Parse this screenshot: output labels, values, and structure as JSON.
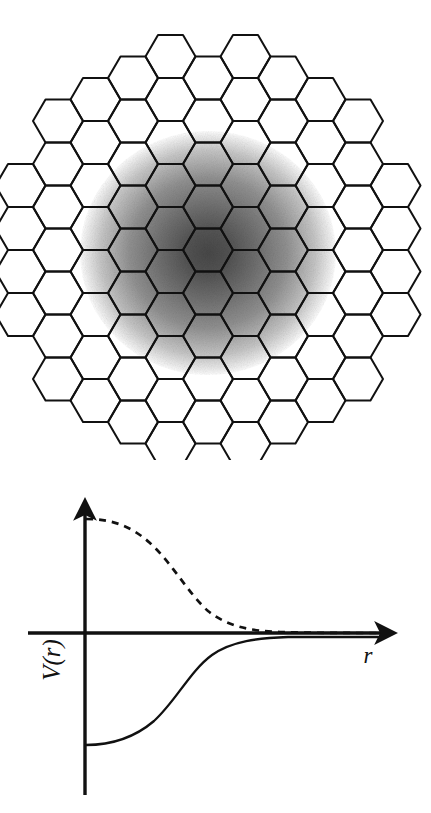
{
  "figure": {
    "title": "",
    "caption": "",
    "background_color": "#ffffff",
    "width": 431,
    "height": 813
  },
  "lattice_panel": {
    "name": "hexagonal-lattice-with-gaussian-blob",
    "description": "Honeycomb lattice of flat-top hexagons arranged in a roughly circular cluster, overlaid on a dark radial gradient blob centred on the lattice",
    "hexagon": {
      "orientation": "flat-top",
      "width_px": 50,
      "height_px": 43,
      "stroke_color": "#111111",
      "stroke_width": 2.0,
      "fill": "none"
    },
    "grid": {
      "column_pitch_px": 37.5,
      "row_pitch_px": 43,
      "center_x": 208,
      "center_y": 250,
      "cluster_radius_px": 205
    },
    "blob": {
      "name": "radial-gradient-blob",
      "center_x": 208,
      "center_y": 253,
      "radius_x": 128,
      "radius_y": 122,
      "core_color": "#4a4a4a",
      "mid_color": "#8e8e8e",
      "edge_color": "#d8d8d8",
      "outer_color": "#ffffff",
      "stops": [
        0,
        18,
        38,
        62,
        84,
        100
      ]
    }
  },
  "potential_panel": {
    "name": "potential-vs-radius-plot",
    "axes": {
      "y_label": "V(r)",
      "x_label": "r",
      "origin_x": 85,
      "origin_y": 178,
      "x_axis_end": 398,
      "y_axis_top": 43,
      "y_axis_bottom": 340,
      "axis_color": "#111111",
      "axis_width": 3.2,
      "arrowheads": [
        "x-axis-right",
        "y-axis-up"
      ]
    },
    "curves": [
      {
        "name": "repulsive-potential-curve",
        "style": "dashed",
        "dash_pattern": "7 6",
        "color": "#111111",
        "stroke_width": 2.6,
        "description": "Positive sigmoid decaying from a plateau above zero down onto the r-axis",
        "start_value": 134,
        "asymptote_value": 0
      },
      {
        "name": "attractive-potential-curve",
        "style": "solid",
        "color": "#111111",
        "stroke_width": 2.2,
        "description": "Negative sigmoid rising from a plateau below zero up onto the r-axis",
        "start_value": -112,
        "asymptote_value": 0
      }
    ]
  },
  "chart_data": {
    "type": "line",
    "title": "",
    "subtitle": "",
    "xlabel": "r",
    "ylabel": "V(r)",
    "grid": false,
    "legend": "none",
    "xlim": [
      0,
      1
    ],
    "ylim": [
      -1.15,
      1.35
    ],
    "annotations": [],
    "x": [
      0.0,
      0.05,
      0.1,
      0.15,
      0.2,
      0.25,
      0.3,
      0.35,
      0.4,
      0.45,
      0.5,
      0.55,
      0.6,
      0.65,
      0.7,
      0.75,
      0.8,
      0.85,
      0.9,
      0.95,
      1.0
    ],
    "series": [
      {
        "name": "repulsive (dashed)",
        "style": "dashed",
        "values": [
          1.3,
          1.29,
          1.26,
          1.21,
          1.13,
          1.02,
          0.88,
          0.72,
          0.56,
          0.42,
          0.3,
          0.21,
          0.15,
          0.1,
          0.07,
          0.05,
          0.035,
          0.025,
          0.018,
          0.012,
          0.008
        ]
      },
      {
        "name": "attractive (solid)",
        "style": "solid",
        "values": [
          -1.1,
          -1.09,
          -1.06,
          -1.01,
          -0.94,
          -0.85,
          -0.73,
          -0.6,
          -0.47,
          -0.35,
          -0.25,
          -0.18,
          -0.12,
          -0.085,
          -0.06,
          -0.04,
          -0.03,
          -0.02,
          -0.015,
          -0.01,
          -0.006
        ]
      }
    ]
  }
}
